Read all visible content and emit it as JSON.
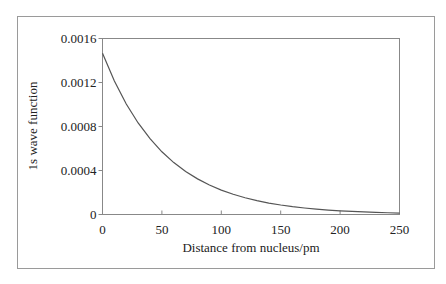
{
  "chart_data": {
    "type": "line",
    "title": "",
    "xlabel": "Distance from nucleus/pm",
    "ylabel": "1s wave function",
    "xlim": [
      0,
      250
    ],
    "ylim": [
      0,
      0.0016
    ],
    "x_ticks": [
      0,
      50,
      100,
      150,
      200,
      250
    ],
    "x_tick_labels": [
      "0",
      "50",
      "100",
      "150",
      "200",
      "250"
    ],
    "y_ticks": [
      0,
      0.0004,
      0.0008,
      0.0012,
      0.0016
    ],
    "y_tick_labels": [
      "0",
      "0.0004",
      "0.0008",
      "0.0012",
      "0.0016"
    ],
    "grid": false,
    "legend": null,
    "series": [
      {
        "name": "1s wave function",
        "color": "#555555",
        "x": [
          0,
          10,
          20,
          30,
          40,
          50,
          60,
          70,
          80,
          90,
          100,
          110,
          120,
          130,
          140,
          150,
          160,
          170,
          180,
          190,
          200,
          210,
          220,
          230,
          240,
          250
        ],
        "values": [
          0.001466,
          0.001214,
          0.001005,
          0.000832,
          0.000689,
          0.00057,
          0.000472,
          0.000391,
          0.000324,
          0.000268,
          0.000222,
          0.000184,
          0.000152,
          0.000126,
          0.000104,
          8.65e-05,
          7.16e-05,
          5.93e-05,
          4.91e-05,
          4.06e-05,
          3.36e-05,
          2.79e-05,
          2.3e-05,
          1.91e-05,
          1.58e-05,
          1.31e-05
        ]
      }
    ]
  },
  "colors": {
    "frame": "#9a9a9a",
    "axis": "#777777",
    "curve": "#555555",
    "text": "#222222"
  }
}
